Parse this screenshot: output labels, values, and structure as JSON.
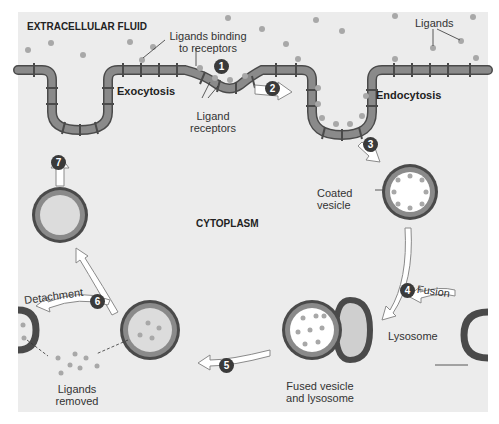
{
  "labels": {
    "extracellular": "EXTRACELLULAR FLUID",
    "cytoplasm": "CYTOPLASM",
    "ligands_binding_1": "Ligands binding",
    "ligands_binding_2": "to receptors",
    "ligands": "Ligands",
    "ligand_receptors_1": "Ligand",
    "ligand_receptors_2": "receptors",
    "exocytosis": "Exocytosis",
    "endocytosis": "Endocytosis",
    "coated_vesicle_1": "Coated",
    "coated_vesicle_2": "vesicle",
    "fusion": "Fusion",
    "lysosome": "Lysosome",
    "fused_1": "Fused vesicle",
    "fused_2": "and lysosome",
    "detachment": "Detachment",
    "ligands_removed_1": "Ligands",
    "ligands_removed_2": "removed"
  },
  "steps": [
    "1",
    "2",
    "3",
    "4",
    "5",
    "6",
    "7"
  ],
  "colors": {
    "background": "#ededed",
    "membrane": "#7a7a7a",
    "membrane_dark": "#4a4a4a",
    "ligand": "#a8a8a8",
    "step_badge": "#3a3a3a",
    "arrow_fill": "#ffffff"
  }
}
